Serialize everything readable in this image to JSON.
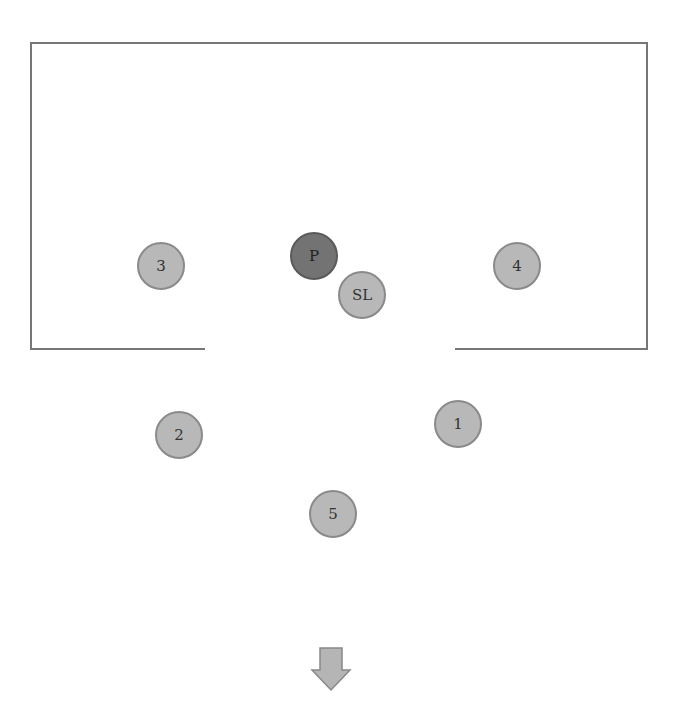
{
  "diagram": {
    "room": {
      "left": 31,
      "top": 43,
      "right": 647,
      "bottom": 349,
      "gap_from": 205,
      "gap_to": 455,
      "stroke": "#777777"
    },
    "nodes": [
      {
        "id": "P",
        "label": "P",
        "x": 314,
        "y": 256,
        "shade": "dark"
      },
      {
        "id": "SL",
        "label": "SL",
        "x": 362,
        "y": 295,
        "shade": "light"
      },
      {
        "id": "3",
        "label": "3",
        "x": 161,
        "y": 266,
        "shade": "light"
      },
      {
        "id": "4",
        "label": "4",
        "x": 517,
        "y": 266,
        "shade": "light"
      },
      {
        "id": "2",
        "label": "2",
        "x": 179,
        "y": 435,
        "shade": "light"
      },
      {
        "id": "1",
        "label": "1",
        "x": 458,
        "y": 424,
        "shade": "light"
      },
      {
        "id": "5",
        "label": "5",
        "x": 333,
        "y": 514,
        "shade": "light"
      }
    ],
    "arrow": {
      "direction": "down",
      "x": 331,
      "top": 648,
      "bottom": 690,
      "fill": "#b5b5b5"
    },
    "colors": {
      "light_node": "#b8b8b8",
      "dark_node": "#737373"
    }
  }
}
